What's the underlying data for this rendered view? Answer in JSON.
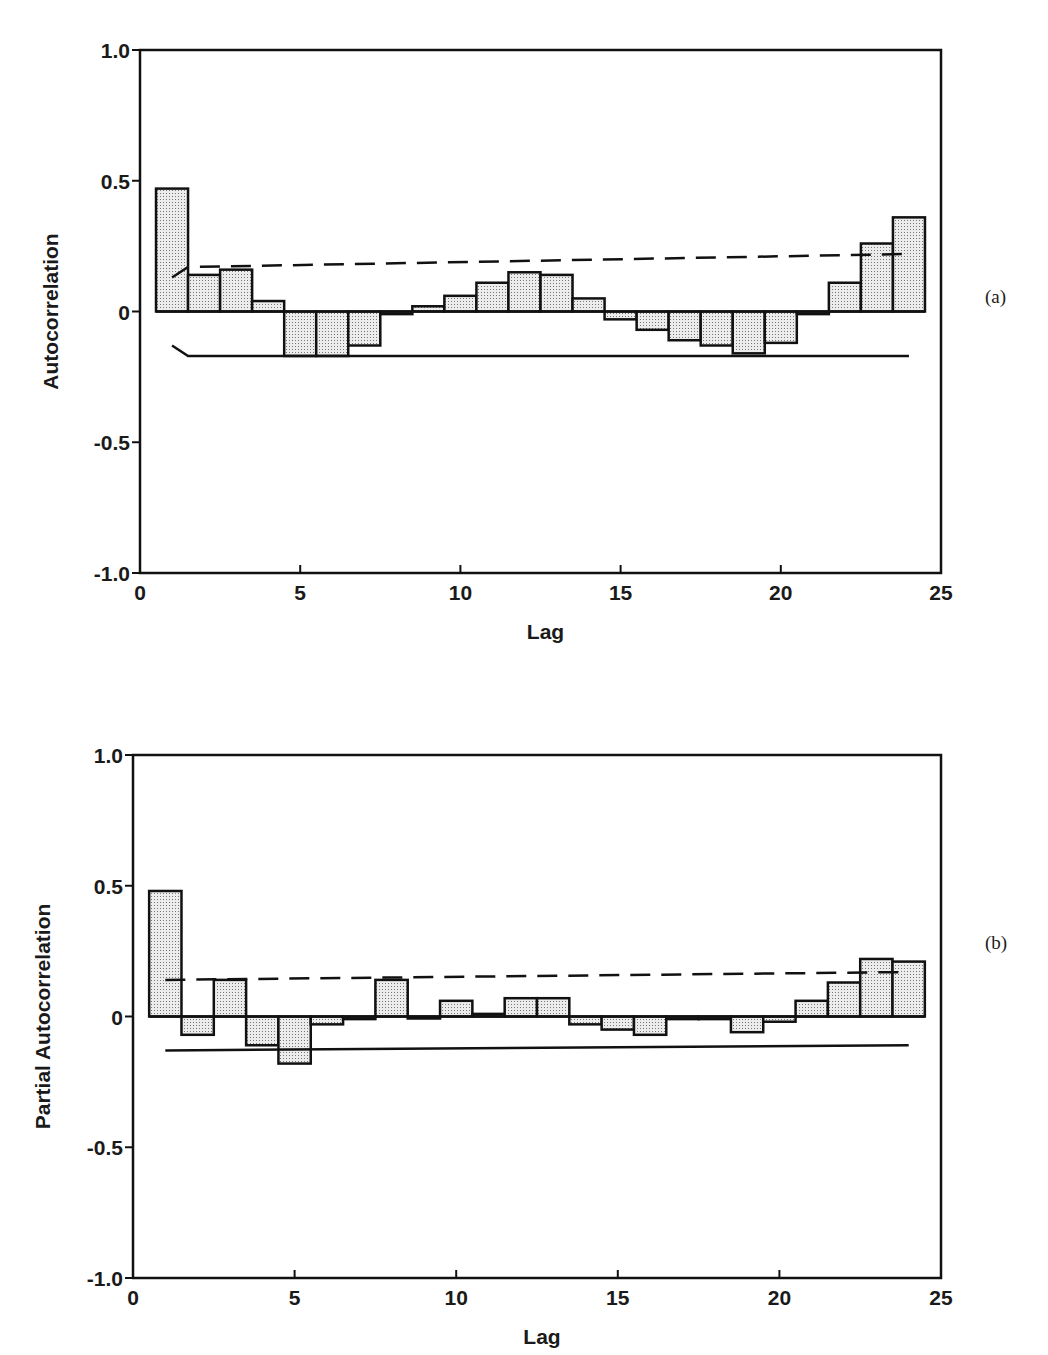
{
  "chart_data": [
    {
      "id": "a",
      "type": "bar",
      "panel_label": "(a)",
      "title": "",
      "xlabel": "Lag",
      "ylabel": "Autocorrelation",
      "xlim": [
        0,
        25
      ],
      "ylim": [
        -1.0,
        1.0
      ],
      "xticks": [
        0,
        5,
        10,
        15,
        20,
        25
      ],
      "yticks": [
        1.0,
        0.5,
        0,
        -0.5,
        -1.0
      ],
      "ytick_labels": [
        "1.0",
        "0.5",
        "0",
        "-0.5",
        "-1.0"
      ],
      "grid": false,
      "legend": null,
      "lags": [
        1,
        2,
        3,
        4,
        5,
        6,
        7,
        8,
        9,
        10,
        11,
        12,
        13,
        14,
        15,
        16,
        17,
        18,
        19,
        20,
        21,
        22,
        23,
        24
      ],
      "values": [
        0.47,
        0.14,
        0.16,
        0.04,
        -0.17,
        -0.17,
        -0.13,
        -0.01,
        0.02,
        0.06,
        0.11,
        0.15,
        0.14,
        0.05,
        -0.03,
        -0.07,
        -0.11,
        -0.13,
        -0.16,
        -0.12,
        -0.01,
        0.11,
        0.26,
        0.36
      ],
      "upper_band": {
        "style": "dashed",
        "x": [
          1,
          1.5,
          24
        ],
        "y": [
          0.13,
          0.17,
          0.22
        ]
      },
      "lower_band": {
        "style": "solid",
        "x": [
          1,
          1.5,
          24
        ],
        "y": [
          -0.13,
          -0.17,
          -0.17
        ]
      }
    },
    {
      "id": "b",
      "type": "bar",
      "panel_label": "(b)",
      "title": "",
      "xlabel": "Lag",
      "ylabel": "Partial Autocorrelation",
      "xlim": [
        0,
        25
      ],
      "ylim": [
        -1.0,
        1.0
      ],
      "xticks": [
        0,
        5,
        10,
        15,
        20,
        25
      ],
      "yticks": [
        1.0,
        0.5,
        0,
        -0.5,
        -1.0
      ],
      "ytick_labels": [
        "1.0",
        "0.5",
        "0",
        "-0.5",
        "-1.0"
      ],
      "grid": false,
      "legend": null,
      "lags": [
        1,
        2,
        3,
        4,
        5,
        6,
        7,
        8,
        9,
        10,
        11,
        12,
        13,
        14,
        15,
        16,
        17,
        18,
        19,
        20,
        21,
        22,
        23,
        24
      ],
      "values": [
        0.48,
        -0.07,
        0.14,
        -0.11,
        -0.18,
        -0.03,
        -0.01,
        0.14,
        0.0,
        0.06,
        0.01,
        0.07,
        0.07,
        -0.03,
        -0.05,
        -0.07,
        -0.01,
        -0.01,
        -0.06,
        -0.02,
        0.06,
        0.13,
        0.22,
        0.21
      ],
      "upper_band": {
        "style": "dashed",
        "x": [
          1,
          24
        ],
        "y": [
          0.14,
          0.17
        ]
      },
      "lower_band": {
        "style": "solid",
        "x": [
          1,
          24
        ],
        "y": [
          -0.13,
          -0.11
        ]
      }
    }
  ],
  "style": {
    "bar_fill": "#d9d9d9",
    "bar_stroke": "#111111",
    "axis_color": "#111111"
  },
  "layout": {
    "a": {
      "left": 140,
      "right": 941,
      "top": 50,
      "bottom": 573,
      "svg_top": 0,
      "tag_x": 985,
      "tag_y": 286
    },
    "b": {
      "left": 133,
      "right": 941,
      "top": 55,
      "bottom": 578,
      "svg_top": 700,
      "tag_x": 985,
      "tag_y": 232
    }
  }
}
